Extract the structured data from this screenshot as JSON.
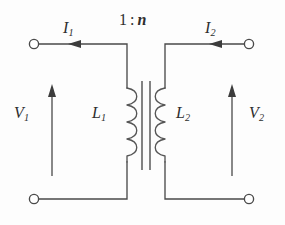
{
  "figure": {
    "kind": "ideal-transformer-circuit",
    "background_color": "#fdfdfd",
    "line_color": "#4a4a4a",
    "text_color": "#2e2e2e"
  },
  "ratio": {
    "primary": "1",
    "separator": ":",
    "secondary": "n",
    "full": "1 : n"
  },
  "labels": {
    "current_primary": {
      "symbol": "I",
      "subscript": "1"
    },
    "current_secondary": {
      "symbol": "I",
      "subscript": "2"
    },
    "voltage_primary": {
      "symbol": "V",
      "subscript": "1"
    },
    "voltage_secondary": {
      "symbol": "V",
      "subscript": "2"
    },
    "inductor_primary": {
      "symbol": "L",
      "subscript": "1"
    },
    "inductor_secondary": {
      "symbol": "L",
      "subscript": "2"
    }
  },
  "terminals": [
    {
      "name": "top-left",
      "x": 34,
      "y": 44,
      "r": 5
    },
    {
      "name": "top-right",
      "x": 249,
      "y": 44,
      "r": 5
    },
    {
      "name": "bottom-left",
      "x": 34,
      "y": 199,
      "r": 5
    },
    {
      "name": "bottom-right",
      "x": 249,
      "y": 199,
      "r": 5
    }
  ],
  "arrows": {
    "current_primary_direction": "right",
    "current_secondary_direction": "right",
    "voltage_primary_direction": "up",
    "voltage_secondary_direction": "up"
  },
  "core": {
    "line_count": 2,
    "x_positions": [
      142,
      150
    ],
    "y_top": 81,
    "y_bottom": 170
  },
  "coils": {
    "turns": 4,
    "primary_x": 127,
    "secondary_x": 165,
    "y_top": 87,
    "y_bottom": 163
  }
}
